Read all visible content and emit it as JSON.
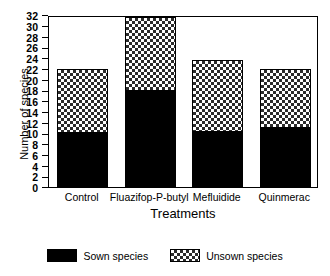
{
  "chart_data": {
    "type": "bar",
    "subtype": "stacked-bar",
    "title": "",
    "xlabel": "Treatments",
    "ylabel": "Number of species",
    "categories": [
      "Control",
      "Fluazifop-P-butyl",
      "Mefluidide",
      "Quinmerac"
    ],
    "series": [
      {
        "name": "Sown species",
        "values": [
          10,
          17.8,
          10.3,
          11
        ]
      },
      {
        "name": "Unsown species",
        "values": [
          12,
          13.8,
          13.4,
          10.9
        ]
      }
    ],
    "totals": [
      22,
      31.6,
      23.7,
      21.9
    ],
    "ylim": [
      0,
      32
    ],
    "ytick_step": 2,
    "yticks": [
      "32",
      "30",
      "28",
      "26",
      "24",
      "22",
      "20",
      "18",
      "16",
      "14",
      "12",
      "10",
      "8",
      "6",
      "4",
      "2",
      "0"
    ],
    "grid": false,
    "legend_position": "bottom",
    "legend": [
      {
        "label": "Sown species",
        "fill": "solid-black"
      },
      {
        "label": "Unsown species",
        "fill": "crosshatch"
      }
    ],
    "colors": {
      "sown": "#000000",
      "unsown_pattern": "#2b2b2b",
      "unsown_background": "#ffffff",
      "axis": "#000000"
    }
  }
}
